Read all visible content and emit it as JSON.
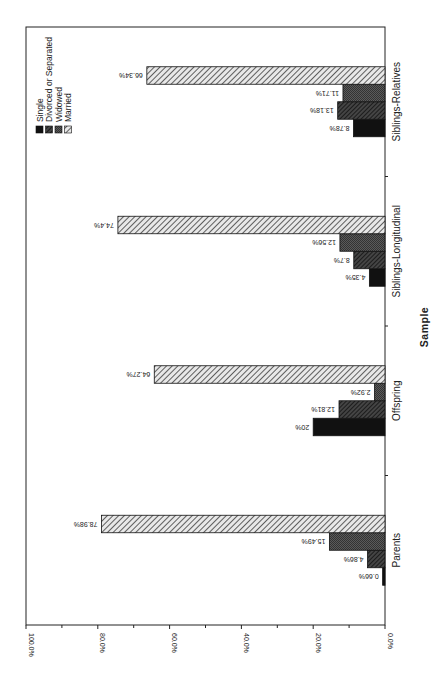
{
  "chart_data": {
    "type": "bar",
    "orientation": "rotated-90 (value axis along bottom, increasing right-to-left; categories along right side)",
    "title": "",
    "xlabel": "Sample",
    "ylabel": "",
    "ylim": [
      0,
      100
    ],
    "yticks": [
      "0.0%",
      "20.0%",
      "40.0%",
      "60.0%",
      "80.0%",
      "100.0%"
    ],
    "categories": [
      "Parents",
      "Offspring",
      "Siblings-Longitudinal",
      "Siblings-Relatives"
    ],
    "series": [
      {
        "name": "Single",
        "values": [
          0.66,
          20,
          4.35,
          8.78
        ],
        "labels": [
          "0.66%",
          "20%",
          "4.35%",
          "8.78%"
        ],
        "fill": "solid-black"
      },
      {
        "name": "Divorced or Separated",
        "values": [
          4.86,
          12.81,
          8.7,
          13.18
        ],
        "labels": [
          "4.86%",
          "12.81%",
          "8.7%",
          "13.18%"
        ],
        "fill": "dark-diagonal-hatch"
      },
      {
        "name": "Widowed",
        "values": [
          15.49,
          2.92,
          12.56,
          11.71
        ],
        "labels": [
          "15.49%",
          "2.92%",
          "12.56%",
          "11.71%"
        ],
        "fill": "dark-gray-crosshatch"
      },
      {
        "name": "Married",
        "values": [
          78.98,
          64.27,
          74.4,
          66.34
        ],
        "labels": [
          "78.98%",
          "64.27%",
          "74.4%",
          "66.34%"
        ],
        "fill": "light-diagonal-hatch"
      }
    ],
    "legend": {
      "position": "top-left inside plot (rotated)",
      "entries": [
        "Single",
        "Divorced or Separated",
        "Widowed",
        "Married"
      ]
    },
    "grid": false
  },
  "axis": {
    "category_title": "Sample"
  }
}
